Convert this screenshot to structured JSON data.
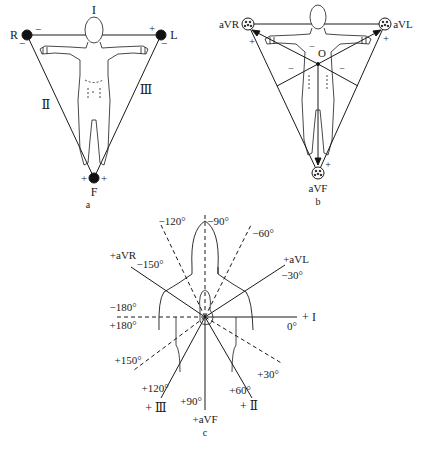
{
  "panel_a": {
    "caption": "a",
    "electrodes": {
      "right": "R",
      "left": "L",
      "foot": "F"
    },
    "leads": {
      "lead1": "I",
      "lead2": "Ⅱ",
      "lead3": "Ⅲ"
    },
    "polarity": {
      "plus": "+",
      "minus": "−"
    }
  },
  "panel_b": {
    "caption": "b",
    "electrodes": {
      "avr": "aVR",
      "avl": "aVL",
      "avf": "aVF"
    },
    "center": "O",
    "polarity": {
      "plus": "+",
      "minus": "−"
    }
  },
  "panel_c": {
    "caption": "c",
    "axes": {
      "lead1": "+ I",
      "lead2": "+ Ⅱ",
      "lead3": "+ Ⅲ",
      "avr": "+aVR",
      "avl": "+aVL",
      "avf": "+aVF"
    },
    "angles": {
      "m120": "−120°",
      "m90": "−90°",
      "m60": "−60°",
      "m150": "−150°",
      "m30": "−30°",
      "m180": "−180°",
      "p180": "+180°",
      "zero": "0°",
      "p150": "+150°",
      "p30": "+30°",
      "p120": "+120°",
      "p60": "+60°",
      "p90": "+90°"
    }
  }
}
